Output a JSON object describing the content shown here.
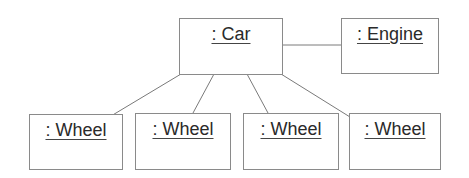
{
  "diagram": {
    "type": "uml-object-diagram",
    "objects": [
      {
        "id": "car",
        "label": ": Car",
        "box": [
          179,
          18,
          104,
          57
        ]
      },
      {
        "id": "engine",
        "label": ": Engine",
        "box": [
          341,
          18,
          98,
          56
        ]
      },
      {
        "id": "wheel1",
        "label": ": Wheel",
        "box": [
          29,
          114,
          94,
          56
        ]
      },
      {
        "id": "wheel2",
        "label": ": Wheel",
        "box": [
          135,
          113,
          96,
          57
        ]
      },
      {
        "id": "wheel3",
        "label": ": Wheel",
        "box": [
          243,
          113,
          96,
          57
        ]
      },
      {
        "id": "wheel4",
        "label": ": Wheel",
        "box": [
          349,
          113,
          92,
          57
        ]
      }
    ],
    "links": [
      {
        "from": "car",
        "to": "engine",
        "points": [
          283,
          45,
          341,
          45
        ]
      },
      {
        "from": "car",
        "to": "wheel1",
        "points": [
          181,
          74,
          111,
          116
        ]
      },
      {
        "from": "car",
        "to": "wheel2",
        "points": [
          214,
          74,
          193,
          113
        ]
      },
      {
        "from": "car",
        "to": "wheel3",
        "points": [
          247,
          74,
          268,
          113
        ]
      },
      {
        "from": "car",
        "to": "wheel4",
        "points": [
          281,
          74,
          350,
          117
        ]
      }
    ],
    "colors": {
      "line": "#7a7a7a",
      "border": "#8a8a8a",
      "text": "#2a2a2a"
    }
  }
}
